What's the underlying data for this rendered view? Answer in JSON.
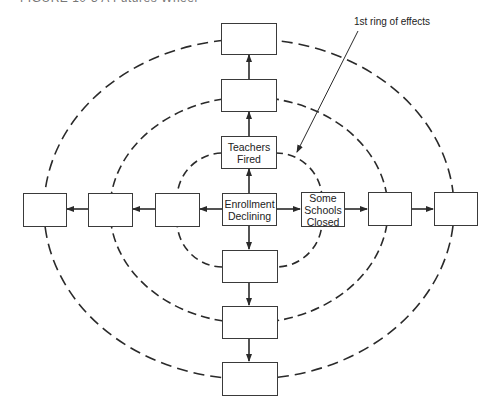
{
  "figure": {
    "caption": "FIGURE 10-3   A Futures Wheel"
  },
  "annotation": {
    "label": "1st ring of effects"
  },
  "center": {
    "line1": "Enrollment",
    "line2": "Declining"
  },
  "first_ring": {
    "top": {
      "line1": "Teachers",
      "line2": "Fired"
    },
    "right": {
      "line1": "Some",
      "line2": "Schools",
      "line3": "Closed"
    },
    "left": {
      "line1": "",
      "line2": ""
    },
    "bottom": {
      "line1": "",
      "line2": ""
    }
  },
  "second_ring": {
    "top": "",
    "right": "",
    "left": "",
    "bottom": ""
  },
  "third_ring": {
    "top": "",
    "right": "",
    "left": "",
    "bottom": ""
  },
  "colors": {
    "line": "#2a2a2a",
    "box_border": "#3a3a3a",
    "background": "#ffffff"
  }
}
